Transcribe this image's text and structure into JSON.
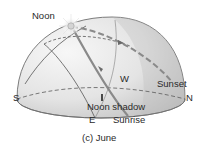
{
  "figure": {
    "caption": "(c) June",
    "labels": {
      "noon": "Noon",
      "west": "W",
      "sunset": "Sunset",
      "south": "S",
      "north": "N",
      "east": "E",
      "sunrise": "Sunrise",
      "noon_shadow": "Noon shadow"
    },
    "colors": {
      "dome_light": "#f2f2f2",
      "dome_shade": "#c4c4c4",
      "dome_outline": "#6e6e6e",
      "path_line": "#8a8a8a",
      "arc_line": "#555555",
      "text": "#2a2a2a",
      "sun": "#d9d9d9"
    }
  }
}
